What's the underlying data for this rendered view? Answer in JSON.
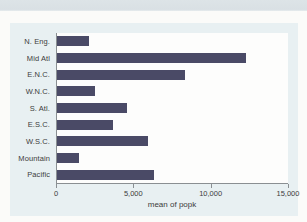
{
  "chart_data": {
    "type": "bar",
    "orientation": "horizontal",
    "title": "",
    "categories": [
      "N. Eng.",
      "Mid Atl",
      "E.N.C.",
      "W.N.C.",
      "S. Atl.",
      "E.S.C.",
      "W.S.C.",
      "Mountain",
      "Pacific"
    ],
    "values": [
      2100,
      12300,
      8300,
      2450,
      4550,
      3650,
      5900,
      1450,
      6300
    ],
    "xlabel": "mean of popk",
    "ylabel": "",
    "xlim": [
      0,
      15000
    ],
    "xticks": [
      0,
      5000,
      10000,
      15000
    ],
    "xtick_labels": [
      "0",
      "5,000",
      "10,000",
      "15,000"
    ],
    "grid": false,
    "legend": "none",
    "colors": {
      "bar": "#4a4a66",
      "chart_background": "#e8f0f2",
      "plot_background": "#fdfdfc",
      "axis_line": "#8a8f92",
      "text": "#3c3c3c",
      "top_band": "#dce3e6"
    }
  }
}
